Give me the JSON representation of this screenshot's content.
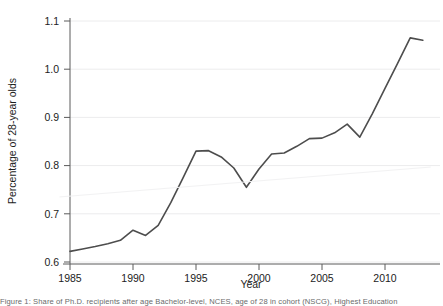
{
  "figure": {
    "background_color": "#ffffff",
    "caption": "Figure 1: Share of Ph.D. recipients after age Bachelor-level, NCES, age of 28 in cohort (NSCG), Highest Education"
  },
  "chart_data": {
    "type": "line",
    "title": "",
    "xlabel": "Year",
    "ylabel": "Percentage of 28-year olds",
    "xlim": [
      1984.2,
      2013.6
    ],
    "ylim": [
      0.585,
      1.115
    ],
    "xticks": [
      1985,
      1990,
      1995,
      2000,
      2005,
      2010
    ],
    "yticks": [
      0.6,
      0.7,
      0.8,
      0.9,
      1.0,
      1.1
    ],
    "xtick_labels": [
      "1985",
      "1990",
      "1995",
      "2000",
      "2005",
      "2010"
    ],
    "ytick_labels": [
      "0.6",
      "0.7",
      "0.8",
      "0.9",
      "1.0",
      "1.1"
    ],
    "grid": "horizontal",
    "grid_color": "#ececed",
    "legend": "none",
    "series": [
      {
        "name": "Percentage of 28-year olds",
        "color": "#4d4d4d",
        "width": 1.6,
        "x": [
          1985,
          1986,
          1987,
          1988,
          1989,
          1990,
          1991,
          1992,
          1993,
          1994,
          1995,
          1996,
          1997,
          1998,
          1999,
          2000,
          2001,
          2002,
          2003,
          2004,
          2005,
          2006,
          2007,
          2008,
          2009,
          2010,
          2011,
          2012,
          2013
        ],
        "values": [
          0.622,
          0.627,
          0.632,
          0.638,
          0.645,
          0.666,
          0.655,
          0.676,
          0.723,
          0.776,
          0.83,
          0.831,
          0.818,
          0.795,
          0.755,
          0.793,
          0.824,
          0.826,
          0.84,
          0.856,
          0.857,
          0.868,
          0.886,
          0.859,
          0.908,
          0.96,
          1.012,
          1.065,
          1.06
        ]
      },
      {
        "name": "linear trend",
        "color": "#f2f2f3",
        "width": 1.0,
        "x": [
          1984.2,
          2013.6
        ],
        "values": [
          0.735,
          0.797
        ]
      }
    ]
  }
}
